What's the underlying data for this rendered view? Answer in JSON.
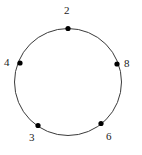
{
  "figure": {
    "kind": "circle-node-diagram",
    "background_color": "#ffffff",
    "stroke_color": "#3a3a3a",
    "node_color": "#000000",
    "label_color": "#1a1a1a",
    "circle": {
      "cx": 68,
      "cy": 82,
      "r": 53.5,
      "stroke_width": 1
    },
    "node_radius": 2.6
  },
  "nodes": [
    {
      "id": "node-2",
      "label": "2",
      "x": 68,
      "y": 28.5,
      "label_x": 64,
      "label_y": 5
    },
    {
      "id": "node-4",
      "label": "4",
      "x": 20,
      "y": 63,
      "label_x": 4,
      "label_y": 57
    },
    {
      "id": "node-8",
      "label": "8",
      "x": 117,
      "y": 64,
      "label_x": 124,
      "label_y": 58
    },
    {
      "id": "node-3",
      "label": "3",
      "x": 38,
      "y": 125.5,
      "label_x": 29,
      "label_y": 132
    },
    {
      "id": "node-6",
      "label": "6",
      "x": 101,
      "y": 123.5,
      "label_x": 106,
      "label_y": 131
    }
  ],
  "labels": {
    "top": "2",
    "left": "4",
    "right": "8",
    "bottom_left": "3",
    "bottom_right": "6"
  }
}
